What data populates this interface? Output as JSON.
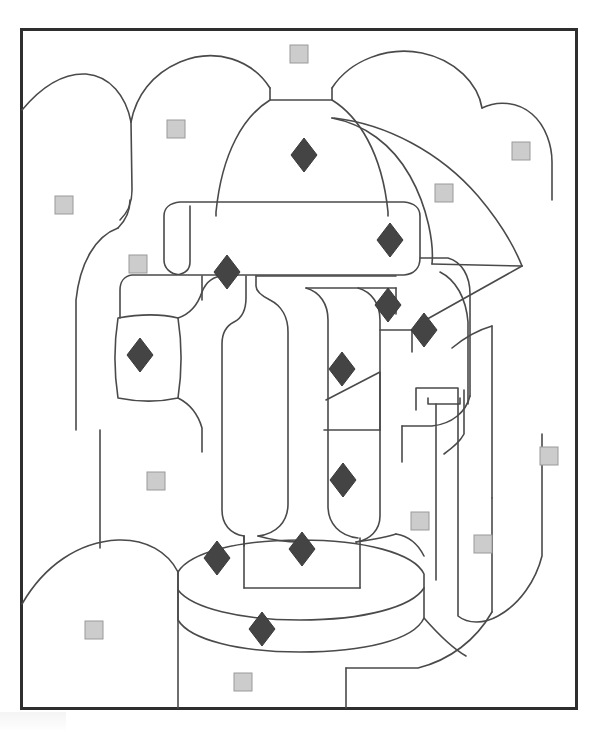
{
  "page": {
    "width": 598,
    "height": 732,
    "background_color": "#ffffff"
  },
  "frame": {
    "name": "artwork-border",
    "x": 20,
    "y": 28,
    "width": 558,
    "height": 682,
    "stroke_color": "#2e2e2e",
    "stroke_width": 3,
    "fill_color": "#ffffff"
  },
  "line_art": {
    "stroke_color": "#4a4a4a",
    "stroke_width": 1.6,
    "fill_color": "none",
    "description": "Coloring book outline drawing of an ornate lantern lamp post standing on a round pedestal, with rounded bush shapes and an awning behind it."
  },
  "legend": {
    "square_marker": {
      "label": "light gray square",
      "fill_color": "#cccccc",
      "stroke_color": "#9a9a9a",
      "size": 18
    },
    "diamond_marker": {
      "label": "dark gray diamond",
      "fill_color": "#444444",
      "stroke_color": "#3a3a3a",
      "width": 26,
      "height": 34
    }
  },
  "markers": {
    "squares": [
      {
        "id": "sq-1",
        "cx": 299,
        "cy": 54,
        "region": "sky-top-center"
      },
      {
        "id": "sq-2",
        "cx": 176,
        "cy": 129,
        "region": "left-bush-upper"
      },
      {
        "id": "sq-3",
        "cx": 521,
        "cy": 151,
        "region": "right-awning-upper"
      },
      {
        "id": "sq-4",
        "cx": 444,
        "cy": 193,
        "region": "awning-panel"
      },
      {
        "id": "sq-5",
        "cx": 64,
        "cy": 205,
        "region": "sky-left"
      },
      {
        "id": "sq-6",
        "cx": 138,
        "cy": 264,
        "region": "left-bush-lower"
      },
      {
        "id": "sq-7",
        "cx": 156,
        "cy": 481,
        "region": "background-left-panel"
      },
      {
        "id": "sq-8",
        "cx": 549,
        "cy": 456,
        "region": "background-right-upper"
      },
      {
        "id": "sq-9",
        "cx": 420,
        "cy": 521,
        "region": "post-right-strip"
      },
      {
        "id": "sq-10",
        "cx": 483,
        "cy": 544,
        "region": "background-right-lower"
      },
      {
        "id": "sq-11",
        "cx": 94,
        "cy": 630,
        "region": "foreground-mound"
      },
      {
        "id": "sq-12",
        "cx": 243,
        "cy": 682,
        "region": "ground-bottom-center"
      }
    ],
    "diamonds": [
      {
        "id": "dm-1",
        "cx": 304,
        "cy": 155,
        "region": "lamp-dome"
      },
      {
        "id": "dm-2",
        "cx": 390,
        "cy": 240,
        "region": "lamp-collar-right"
      },
      {
        "id": "dm-3",
        "cx": 227,
        "cy": 272,
        "region": "lamp-collar-left"
      },
      {
        "id": "dm-4",
        "cx": 388,
        "cy": 305,
        "region": "lamp-body-upper-right"
      },
      {
        "id": "dm-5",
        "cx": 424,
        "cy": 330,
        "region": "lamp-side-flange"
      },
      {
        "id": "dm-6",
        "cx": 140,
        "cy": 355,
        "region": "left-oval-ornament"
      },
      {
        "id": "dm-7",
        "cx": 342,
        "cy": 369,
        "region": "lamp-body-center"
      },
      {
        "id": "dm-8",
        "cx": 343,
        "cy": 480,
        "region": "lamp-body-lower"
      },
      {
        "id": "dm-9",
        "cx": 217,
        "cy": 558,
        "region": "pedestal-top-left"
      },
      {
        "id": "dm-10",
        "cx": 302,
        "cy": 549,
        "region": "pedestal-top-center"
      },
      {
        "id": "dm-11",
        "cx": 262,
        "cy": 629,
        "region": "pedestal-base-front"
      }
    ]
  },
  "counts": {
    "squares": 12,
    "diamonds": 11
  }
}
